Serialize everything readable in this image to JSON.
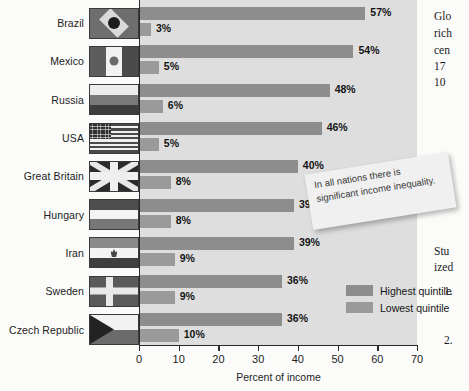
{
  "chart_data": {
    "type": "bar",
    "orientation": "horizontal",
    "title": "",
    "xlabel": "Percent of income",
    "ylabel": "",
    "xlim": [
      0,
      70
    ],
    "xticks": [
      0,
      10,
      20,
      30,
      40,
      50,
      60,
      70
    ],
    "grid": false,
    "legend_position": "inside-bottom-right",
    "categories": [
      "Brazil",
      "Mexico",
      "Russia",
      "USA",
      "Great Britain",
      "Hungary",
      "Iran",
      "Sweden",
      "Czech Republic"
    ],
    "series": [
      {
        "name": "Highest quintile",
        "color": "#8d8d8d",
        "values": [
          57,
          54,
          48,
          46,
          40,
          39,
          39,
          36,
          36
        ],
        "labels": [
          "57%",
          "54%",
          "48%",
          "46%",
          "40%",
          "39%",
          "39%",
          "36%",
          "36%"
        ]
      },
      {
        "name": "Lowest quintile",
        "color": "#9a9a9a",
        "values": [
          3,
          5,
          6,
          5,
          8,
          8,
          9,
          9,
          10
        ],
        "labels": [
          "3%",
          "5%",
          "6%",
          "5%",
          "8%",
          "8%",
          "9%",
          "9%",
          "10%"
        ]
      }
    ],
    "flags": [
      "brazil",
      "mexico",
      "russia",
      "usa",
      "great-britain",
      "hungary",
      "iran",
      "sweden",
      "czech-republic"
    ],
    "annotation": "In all nations there is significant income inequality."
  },
  "legend": {
    "items": [
      {
        "label": "Highest quintile",
        "color": "#8d8d8d"
      },
      {
        "label": "Lowest quintile",
        "color": "#9a9a9a"
      }
    ]
  },
  "axis": {
    "title": "Percent of income",
    "ticks": [
      "0",
      "10",
      "20",
      "30",
      "40",
      "50",
      "60",
      "70"
    ]
  },
  "callout": {
    "text": "In all nations there is significant income inequality."
  },
  "book_text": {
    "lines": [
      "Glo",
      "rich",
      "cen",
      "17",
      "10",
      "Stu",
      "ized",
      "1.",
      "2."
    ]
  }
}
